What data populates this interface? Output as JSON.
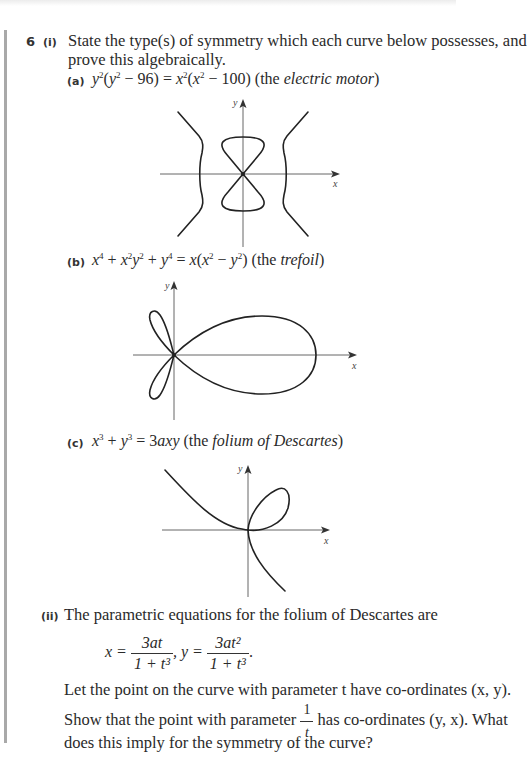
{
  "question": {
    "number": "6",
    "part_i": {
      "label": "(i)",
      "line1": "State the type(s) of symmetry which each curve below possesses, and",
      "line2": "prove this algebraically.",
      "items": [
        {
          "label": "(a)",
          "equation": "y²(y² − 96) = x²(x² − 100)",
          "name_prefix": "(the ",
          "name": "electric motor",
          "name_suffix": ")"
        },
        {
          "label": "(b)",
          "equation": "x⁴ + x²y² + y⁴ = x(x² − y²)",
          "name_prefix": "(the ",
          "name": "trefoil",
          "name_suffix": ")"
        },
        {
          "label": "(c)",
          "equation": "x³ + y³ = 3axy",
          "name_prefix": "(the ",
          "name": "folium of Descartes",
          "name_suffix": ")"
        }
      ]
    },
    "part_ii": {
      "label": "(ii)",
      "intro": "The parametric equations for the folium of Descartes are",
      "eq_x_lhs": "x =",
      "eq_x_num": "3at",
      "eq_x_den": "1 + t³",
      "eq_sep": ", y =",
      "eq_y_num": "3at²",
      "eq_y_den": "1 + t³",
      "eq_end": ".",
      "line1": "Let the point on the curve with parameter t have co-ordinates (x, y).",
      "line2_pre": "Show that the point with parameter",
      "frac_num": "1",
      "frac_den": "t",
      "line2_post": "has co-ordinates (y, x). What",
      "line3": "does this imply for the symmetry of the curve?"
    }
  },
  "graphs": {
    "axis_x_label": "x",
    "axis_y_label": "y"
  }
}
